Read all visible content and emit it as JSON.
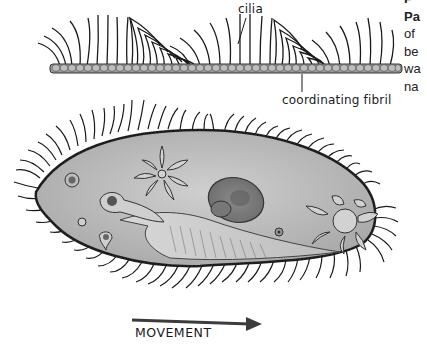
{
  "figure": {
    "labels": {
      "cilia": "cilia",
      "coordinating_fibril": "coordinating fibril",
      "movement": "MOVEMENT"
    },
    "side_caption_fragments": [
      "P",
      "Pa",
      "of",
      "be",
      "wa",
      "na"
    ],
    "colors": {
      "ink": "#1a1a1a",
      "cell_fill": "#bdbdbd",
      "cell_border": "#2a2a2a",
      "arrow": "#3c3c3c",
      "background": "#ffffff"
    },
    "parts": [
      "cilia-row",
      "coordinating-fibril",
      "paramecium-body",
      "macronucleus",
      "micronucleus",
      "contractile-vacuole-anterior",
      "contractile-vacuole-posterior",
      "oral-groove",
      "food-vacuole",
      "anal-pore",
      "movement-arrow"
    ]
  }
}
